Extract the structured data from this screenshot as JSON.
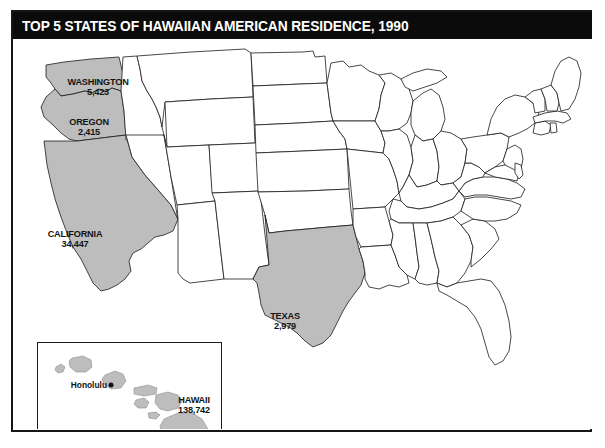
{
  "title": "TOP 5 STATES OF HAWAIIAN AMERICAN RESIDENCE, 1990",
  "colors": {
    "title_bar_bg": "#0b0b0b",
    "title_text": "#ffffff",
    "highlight_fill": "#bdbdbd",
    "base_fill": "#ffffff",
    "outline": "#1a1a1a",
    "page_bg": "#ffffff"
  },
  "map": {
    "type": "choropleth-highlight",
    "region": "United States",
    "highlighted_states": [
      {
        "name": "WASHINGTON",
        "value": "5,423",
        "count": 5423,
        "rank": 3
      },
      {
        "name": "OREGON",
        "value": "2,415",
        "count": 2415,
        "rank": 5
      },
      {
        "name": "CALIFORNIA",
        "value": "34,447",
        "count": 34447,
        "rank": 2
      },
      {
        "name": "TEXAS",
        "value": "2,979",
        "count": 2979,
        "rank": 4
      },
      {
        "name": "HAWAII",
        "value": "138,742",
        "count": 138742,
        "rank": 1
      }
    ],
    "city_markers": [
      {
        "name": "Honolulu",
        "state": "HAWAII"
      }
    ]
  },
  "inset": {
    "name": "hawaii-inset",
    "label": "HAWAII",
    "value": "138,742"
  }
}
